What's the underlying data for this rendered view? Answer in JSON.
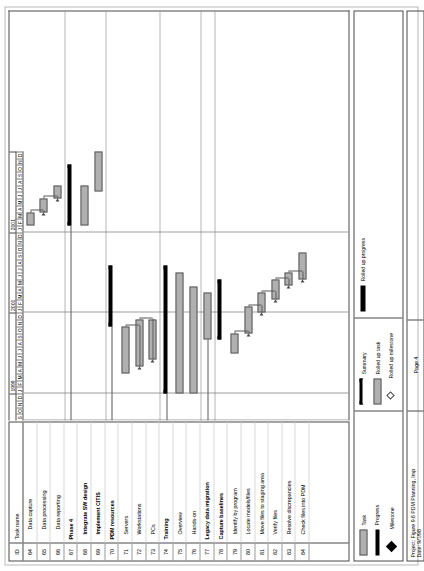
{
  "document": {
    "title": "Figure 9.6 PDM Planning, Imp",
    "page_label": "Page 4",
    "project_line": "Project: Figure 9.6 PDM Planning, Imp",
    "date_line": "Date: 9/7/98"
  },
  "table": {
    "header": {
      "id": "ID",
      "name": "Task name"
    },
    "rows": [
      {
        "id": "64",
        "name": "Data capture",
        "bold": false,
        "indent": 2
      },
      {
        "id": "65",
        "name": "Data processing",
        "bold": false,
        "indent": 2
      },
      {
        "id": "66",
        "name": "Data reporting",
        "bold": false,
        "indent": 2
      },
      {
        "id": "67",
        "name": "Phase 4",
        "bold": true,
        "indent": 0
      },
      {
        "id": "68",
        "name": "Integrate SW design",
        "bold": true,
        "indent": 1
      },
      {
        "id": "69",
        "name": "Implement CITIS",
        "bold": true,
        "indent": 1
      },
      {
        "id": "70",
        "name": "PDM resources",
        "bold": true,
        "indent": 0
      },
      {
        "id": "71",
        "name": "Servers",
        "bold": false,
        "indent": 1
      },
      {
        "id": "72",
        "name": "Workstations",
        "bold": false,
        "indent": 1
      },
      {
        "id": "73",
        "name": "PCs",
        "bold": false,
        "indent": 1
      },
      {
        "id": "74",
        "name": "Training",
        "bold": true,
        "indent": 0
      },
      {
        "id": "75",
        "name": "Overview",
        "bold": false,
        "indent": 1
      },
      {
        "id": "76",
        "name": "Hands-on",
        "bold": false,
        "indent": 1
      },
      {
        "id": "77",
        "name": "Legacy data migration",
        "bold": true,
        "indent": 0
      },
      {
        "id": "78",
        "name": "Capture baselines",
        "bold": true,
        "indent": 0
      },
      {
        "id": "79",
        "name": "Identify by program",
        "bold": false,
        "indent": 1
      },
      {
        "id": "80",
        "name": "Locate models/files",
        "bold": false,
        "indent": 1
      },
      {
        "id": "81",
        "name": "Move files to staging area",
        "bold": false,
        "indent": 1
      },
      {
        "id": "82",
        "name": "Verify files",
        "bold": false,
        "indent": 1
      },
      {
        "id": "83",
        "name": "Resolve discrepancies",
        "bold": false,
        "indent": 1
      },
      {
        "id": "84",
        "name": "Check files into PDM",
        "bold": false,
        "indent": 1
      }
    ]
  },
  "timescale": {
    "months": [
      "S",
      "O",
      "N",
      "D",
      "J",
      "F",
      "M",
      "A",
      "M",
      "J",
      "J",
      "A",
      "S",
      "O",
      "N",
      "D",
      "J",
      "F",
      "M",
      "A",
      "M",
      "J",
      "J",
      "A",
      "S",
      "O",
      "N",
      "D",
      "J",
      "F",
      "M",
      "A",
      "M",
      "J",
      "J",
      "A",
      "S",
      "O",
      "N",
      "D"
    ],
    "years": [
      {
        "label": "",
        "start": 0,
        "span": 4
      },
      {
        "label": "1999",
        "start": 4,
        "span": 12
      },
      {
        "label": "2000",
        "start": 16,
        "span": 12
      },
      {
        "label": "2001",
        "start": 28,
        "span": 12
      }
    ]
  },
  "chart_data": {
    "type": "gantt",
    "title": "Figure 9.6 PDM Planning, Imp",
    "time_unit": "month",
    "time_start": "1998-09",
    "time_end": "2001-12",
    "total_months": 40,
    "tasks": [
      {
        "id": "64",
        "name": "Data capture",
        "kind": "task",
        "start_month": 29,
        "end_month": 31
      },
      {
        "id": "65",
        "name": "Data processing",
        "kind": "task",
        "start_month": 31,
        "end_month": 33
      },
      {
        "id": "66",
        "name": "Data reporting",
        "kind": "task",
        "start_month": 33,
        "end_month": 35
      },
      {
        "id": "67",
        "name": "Phase 4",
        "kind": "summary",
        "start_month": 29,
        "end_month": 38
      },
      {
        "id": "68",
        "name": "Integrate SW design",
        "kind": "task",
        "start_month": 29,
        "end_month": 35
      },
      {
        "id": "69",
        "name": "Implement CITIS",
        "kind": "task",
        "start_month": 34,
        "end_month": 40
      },
      {
        "id": "70",
        "name": "PDM resources",
        "kind": "summary",
        "start_month": 14,
        "end_month": 23
      },
      {
        "id": "71",
        "name": "Servers",
        "kind": "task",
        "start_month": 7,
        "end_month": 14
      },
      {
        "id": "72",
        "name": "Workstations",
        "kind": "task",
        "start_month": 8,
        "end_month": 15
      },
      {
        "id": "73",
        "name": "PCs",
        "kind": "task",
        "start_month": 9,
        "end_month": 15
      },
      {
        "id": "74",
        "name": "Training",
        "kind": "summary",
        "start_month": 4,
        "end_month": 23
      },
      {
        "id": "75",
        "name": "Overview",
        "kind": "task",
        "start_month": 4,
        "end_month": 22
      },
      {
        "id": "76",
        "name": "Hands-on",
        "kind": "task",
        "start_month": 4,
        "end_month": 20
      },
      {
        "id": "77",
        "name": "Legacy data migration",
        "kind": "task",
        "start_month": 12,
        "end_month": 19
      },
      {
        "id": "78",
        "name": "Capture baselines",
        "kind": "summary",
        "start_month": 12,
        "end_month": 21
      },
      {
        "id": "79",
        "name": "Identify by program",
        "kind": "task",
        "start_month": 10,
        "end_month": 13
      },
      {
        "id": "80",
        "name": "Locate models/files",
        "kind": "task",
        "start_month": 13,
        "end_month": 17
      },
      {
        "id": "81",
        "name": "Move files to staging area",
        "kind": "task",
        "start_month": 16,
        "end_month": 19
      },
      {
        "id": "82",
        "name": "Verify files",
        "kind": "task",
        "start_month": 18,
        "end_month": 21
      },
      {
        "id": "83",
        "name": "Resolve discrepancies",
        "kind": "task",
        "start_month": 20,
        "end_month": 22
      },
      {
        "id": "84",
        "name": "Check files into PDM",
        "kind": "task",
        "start_month": 21,
        "end_month": 25
      }
    ]
  },
  "legend": {
    "columns": [
      {
        "items": [
          {
            "label": "Task",
            "swatch": "task-bar-swatch"
          },
          {
            "label": "Progress",
            "swatch": "progress-bar-swatch"
          },
          {
            "label": "Milestone",
            "swatch": "milestone-diamond-icon"
          }
        ]
      },
      {
        "items": [
          {
            "label": "Summary",
            "swatch": "summary-bracket-swatch"
          },
          {
            "label": "Rolled up task",
            "swatch": "rolled-up-task-swatch"
          },
          {
            "label": "Rolled up milestone",
            "swatch": "rolled-up-milestone-icon"
          }
        ]
      },
      {
        "items": [
          {
            "label": "Rolled up progress",
            "swatch": "rolled-up-progress-swatch"
          }
        ]
      }
    ]
  },
  "colors": {
    "bar_fill": "#b0b0b0",
    "bar_border": "#5a5a5a",
    "summary": "#000000",
    "grid": "#9d9d9d",
    "paper": "#ffffff"
  }
}
